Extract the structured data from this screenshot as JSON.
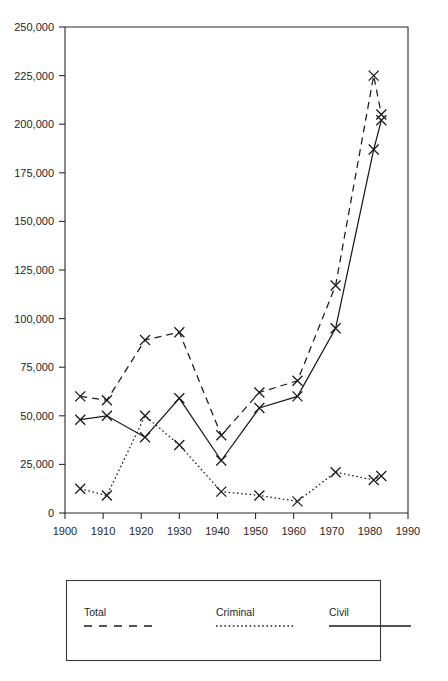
{
  "chart_data": {
    "type": "line",
    "title": "",
    "subtitle": "",
    "xlabel": "",
    "ylabel": "",
    "xlim": [
      1900,
      1990
    ],
    "ylim": [
      0,
      250000
    ],
    "grid": false,
    "legend_position": "bottom",
    "x_ticks": [
      "1900",
      "1910",
      "1920",
      "1930",
      "1940",
      "1950",
      "1960",
      "1970",
      "1980",
      "1990"
    ],
    "x_tick_values": [
      1900,
      1910,
      1920,
      1930,
      1940,
      1950,
      1960,
      1970,
      1980,
      1990
    ],
    "y_ticks": [
      "0",
      "25,000",
      "50,000",
      "75,000",
      "100,000",
      "125,000",
      "150,000",
      "175,000",
      "200,000",
      "225,000",
      "250,000"
    ],
    "y_tick_values": [
      0,
      25000,
      50000,
      75000,
      100000,
      125000,
      150000,
      175000,
      200000,
      225000,
      250000
    ],
    "series": [
      {
        "name": "Total",
        "style": "dashed",
        "marker": "x",
        "x": [
          1904,
          1911,
          1921,
          1930,
          1941,
          1951,
          1961,
          1971,
          1981,
          1983
        ],
        "values": [
          60000,
          58000,
          89000,
          93000,
          40000,
          62000,
          68000,
          117000,
          225000,
          205000
        ]
      },
      {
        "name": "Criminal",
        "style": "dotted",
        "marker": "x",
        "x": [
          1904,
          1911,
          1921,
          1930,
          1941,
          1951,
          1961,
          1971,
          1981,
          1983
        ],
        "values": [
          12500,
          9000,
          50000,
          35000,
          11000,
          9000,
          6000,
          21000,
          17000,
          19000
        ]
      },
      {
        "name": "Civil",
        "style": "solid",
        "marker": "x",
        "x": [
          1904,
          1911,
          1921,
          1930,
          1941,
          1951,
          1961,
          1971,
          1981,
          1983
        ],
        "values": [
          48000,
          50000,
          39000,
          59000,
          27000,
          54000,
          60000,
          95000,
          187000,
          202000
        ]
      }
    ]
  },
  "legend": {
    "entries": [
      {
        "label": "Total",
        "style": "dashed"
      },
      {
        "label": "Criminal",
        "style": "dotted"
      },
      {
        "label": "Civil",
        "style": "solid"
      }
    ]
  }
}
